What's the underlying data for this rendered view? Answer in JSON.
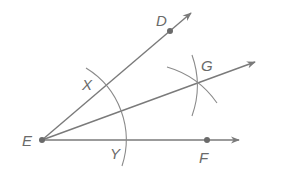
{
  "diagram": {
    "vertex": {
      "label": "E",
      "x": 42,
      "y": 140
    },
    "points": [
      {
        "label": "D",
        "x": 170,
        "y": 31,
        "label_x": 157,
        "label_y": 14
      },
      {
        "label": "F",
        "x": 207,
        "y": 140,
        "label_x": 200,
        "label_y": 150
      },
      {
        "label": "X",
        "x": 106,
        "y": 85,
        "label_x": 82,
        "label_y": 76
      },
      {
        "label": "Y",
        "x": 126,
        "y": 140,
        "label_x": 111,
        "label_y": 145
      },
      {
        "label": "G",
        "x": 197,
        "y": 82,
        "label_x": 202,
        "label_y": 59
      }
    ],
    "rays": [
      {
        "name": "ray-ED",
        "to": [
          192,
          12
        ]
      },
      {
        "name": "ray-EG",
        "to": [
          256,
          61
        ]
      },
      {
        "name": "ray-EF",
        "to": [
          240,
          140
        ]
      }
    ],
    "colors": {
      "line": "#7a7a7a",
      "point": "#6a6a6a",
      "label": "#6a6a6a"
    }
  }
}
